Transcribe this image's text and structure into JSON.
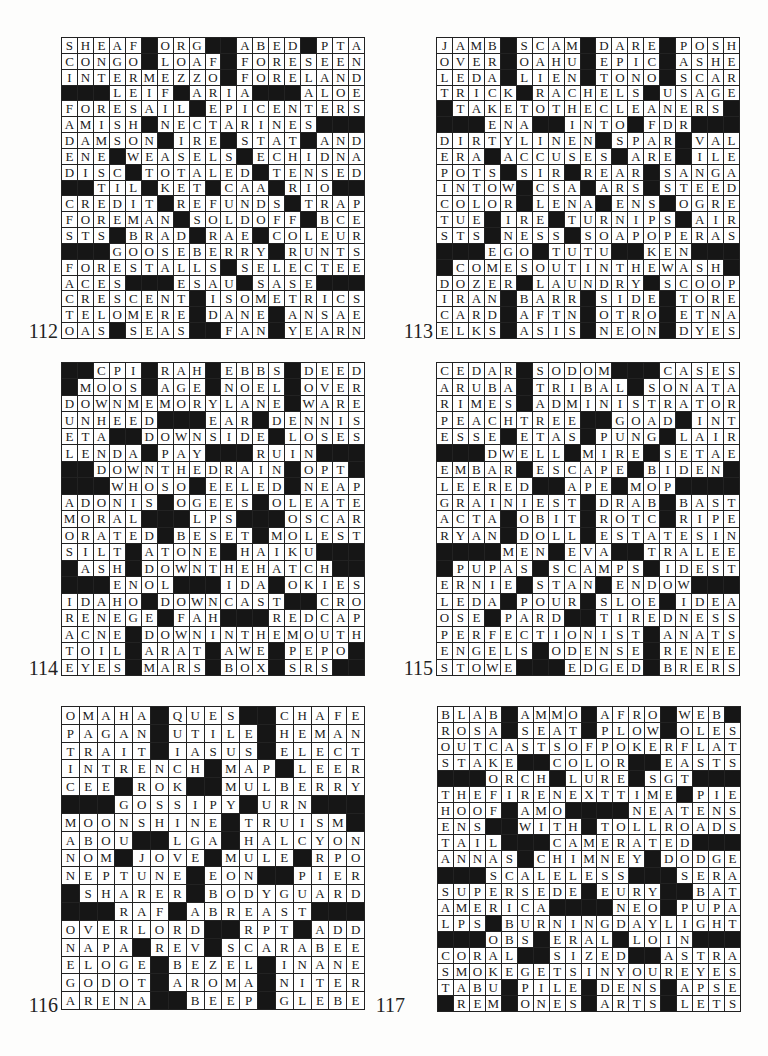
{
  "page": {
    "puzzles": [
      {
        "number": "112",
        "cols": 19,
        "rows": [
          "SHEAF#ORG##ABED#PTA",
          "CONGO#LOAF#FORESEEN",
          "INTERMEZZO#FORELAND",
          "###LEIF#ARIA###ALOE",
          "FORESAIL#EPICENTERS",
          "AMISH#NECTARINES###",
          "DAMSON#IRE#STAT#AND",
          "ENE#WEASELS#ECHIDNA",
          "DISC#TOTALED#TENSED",
          "##TIL#KET#CAA#RIO##",
          "CREDIT#REFUNDS#TRAP",
          "FOREMAN#SOLDOFF#BCE",
          "STS#BRAD#RAE#COLEUR",
          "###GOOSEBERRY#RUNTS",
          "FORESTALLS#SELECTEE",
          "ACES###ESAU#SASE###",
          "CRESCENT#ISOMETRICS",
          "TELOMERE#DANE#ANSAE",
          "OAS#SEAS##FAN#YEARN"
        ]
      },
      {
        "number": "113",
        "cols": 19,
        "rows": [
          "JAMB#SCAM#DARE#POSH",
          "OVER#OAHU#EPIC#ASHE",
          "LEDA#LIEN#TONO#SCAR",
          "TRICK#RACHELS#USAGE",
          "#TAKETOTHECLEANERS#",
          "###ENA##INTO#FDR###",
          "DIRTYLINEN#SPAR#VAL",
          "ERA#ACCUSES#ARE#ILE",
          "POTS#SIR#REAR#SANGA",
          "INTOW#CSA#ARS#STEED",
          "COLOR#LENA#ENS#OGRE",
          "TUE#IRE#TURNIPS#AIR",
          "STS#NESS#SOAPOPERAS",
          "###EGO#TUTU##KEN###",
          "#COMESOUTINTHEWASH#",
          "DOZER#LAUNDRY#SCOOP",
          "IRAN#BARR#SIDE#TORE",
          "CARD#AFTN#OTRO#ETNA",
          "ELKS#ASIS#NEON#DYES"
        ]
      },
      {
        "number": "114",
        "cols": 19,
        "rows": [
          "##CPI#RAH#EBBS#DEED",
          "#MOOS#AGE#NOEL#OVER",
          "DOWNMEMORYLANE#WARE",
          "UNHEED###EAR#DENNIS",
          "ETA##DOWNSIDE#LOSES",
          "LENDA#PAY###RUIN###",
          "##DOWNTHEDRAIN#OPT#",
          "###WHOSO#EELED#NEAP",
          "ADONIS#OGEES#OLEATE",
          "MORAL###LPS###OSCAR",
          "ORATED#BESET#MOLEST",
          "SILT#ATONE#HAIKU###",
          "#ASH#DOWNTHEHATCH##",
          "###ENOL###IDA#OKIES",
          "IDAHO#DOWNCAST##CRO",
          "RENEGE#FAH###REDCAP",
          "ACNE#DOWNINTHEMOUTH",
          "TOIL#ARAT#AWE#PEPO#",
          "EYES#MARS#BOX#SRS##"
        ]
      },
      {
        "number": "115",
        "cols": 19,
        "rows": [
          "CEDAR#SODOM###CASES",
          "ARUBA#TRIBAL#SONATA",
          "RIMES#ADMINISTRATOR",
          "PEACHTREE##GOAD#INT",
          "ESSE#ETAS#PUNG#LAIR",
          "###DWELL#MIRE#SETAE",
          "EMBAR#ESCAPE#BIDEN#",
          "LEERED##APE#MOP####",
          "GRAINIEST#DRAB#BAST",
          "ACTA#OBIT#ROTC#RIPE",
          "RYAN#DOLL#ESTATESIN",
          "####MEN#EVA##TRALEE",
          "#PUPAS#SCAMPS#IDEST",
          "ERNIE#STAN#ENDOW###",
          "LEDA#POUR#SLOE#IDEA",
          "OSE#PARD##TIREDNESS",
          "PERFECTIONIST#ANATS",
          "ENGELS#ODENSE#RENEE",
          "STOWE###EDGED#BRERS"
        ]
      },
      {
        "number": "116",
        "cols": 17,
        "rows": [
          "OMAHA#QUES##CHAFE",
          "PAGAN#UTILE#HEMAN",
          "TRAIT#IASUS#ELECT",
          "INTRENCH#MAP#LEER",
          "CEE#ROK##MULBERRY",
          "###GOSSIPY#URN###",
          "MOONSHINE#TRUISM#",
          "ABOU##LGA#HALCYON",
          "NOM#JOVE#MULE#RPO",
          "NEPTUNE#EON##PIER",
          "#SHARER#BODYGUARD",
          "###RAF#ABREAST###",
          "OVERLORD##RPT#ADD",
          "NAPA#REV#SCARABEE",
          "ELOGE#BEZEL#INANE",
          "GODOT#AROMA#NITER",
          "ARENA##BEEP#GLEBE"
        ]
      },
      {
        "number": "117",
        "cols": 19,
        "rows": [
          "BLAB#AMMO#AFRO#WEB#",
          "ROSA#SEAT#PLOW#OLES",
          "OUTCASTSOFPOKERFLAT",
          "STAKE##COLOR##EASTS",
          "###ORCH#LURE#SGT###",
          "THEFIRENEXTTIME#PIE",
          "HOOF#AMO####NEATENS",
          "ENS##WITH#TOLLROADS",
          "TAIL###CAMERATED###",
          "ANNAS#CHIMNEY#DODGE",
          "###SCALELESS###SERA",
          "SUPERSEDE#EURY##BAT",
          "AMERICA####NEO#PUPA",
          "LPS#BURNINGDAYLIGHT",
          "###OBS#ERAL#LOIN###",
          "CORAL##SIZED##ASTRA",
          "SMOKEGETSINYOUREYES",
          "TABU#PILE#DENS#APSE",
          "#REM#ONES#ARTS#LETS"
        ]
      }
    ]
  }
}
